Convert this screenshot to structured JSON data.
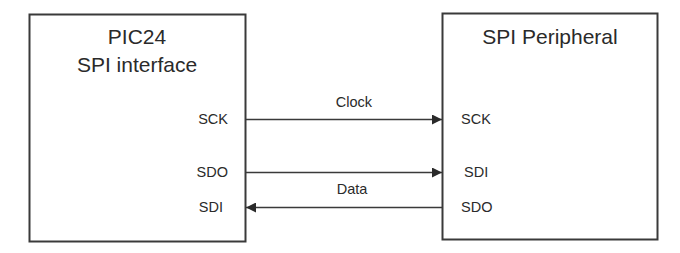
{
  "diagram": {
    "type": "block-diagram",
    "blocks": [
      {
        "id": "pic24",
        "title_lines": [
          "PIC24",
          "SPI interface"
        ],
        "pins": [
          "SCK",
          "SDO",
          "SDI"
        ]
      },
      {
        "id": "peripheral",
        "title_lines": [
          "SPI Peripheral"
        ],
        "pins": [
          "SCK",
          "SDI",
          "SDO"
        ]
      }
    ],
    "connections": [
      {
        "from": "pic24.SCK",
        "to": "peripheral.SCK",
        "direction": "right",
        "label": "Clock"
      },
      {
        "from": "pic24.SDO",
        "to": "peripheral.SDI",
        "direction": "right",
        "label": ""
      },
      {
        "from": "peripheral.SDO",
        "to": "pic24.SDI",
        "direction": "left",
        "label": "Data"
      }
    ],
    "labels": {
      "clock": "Clock",
      "data": "Data"
    }
  },
  "colors": {
    "line": "#3a3a3a",
    "text": "#2a2a2a",
    "background": "#ffffff"
  }
}
